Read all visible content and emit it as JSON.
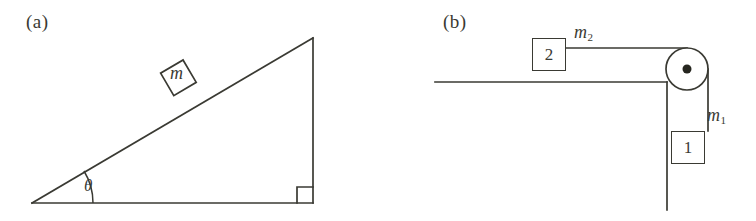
{
  "figure": {
    "width": 756,
    "height": 221,
    "background_color": "#ffffff",
    "line_color": "#3a3a33",
    "type": "physics-mechanics-diagram",
    "panel_count": 2
  },
  "panel_a": {
    "label": "(a)",
    "description": "Inclined plane with a block resting on the incline surface",
    "mass_label": "m",
    "angle_label": "θ",
    "right_angle_marker": true,
    "geometry": {
      "apex_left": [
        32,
        203
      ],
      "corner_bottom_right": [
        313,
        203
      ],
      "corner_top_right": [
        313,
        38
      ],
      "incline_angle_degrees": 30
    },
    "block": {
      "shape": "square",
      "size": 26,
      "rotation_degrees": 30,
      "position_along_incline": 0.47
    }
  },
  "panel_b": {
    "label": "(b)",
    "description": "Two blocks connected by a string over a pulley at the table edge",
    "table_block": {
      "number": "2",
      "mass_label": "m",
      "mass_subscript": "2"
    },
    "hanging_block": {
      "number": "1",
      "mass_label": "m",
      "mass_subscript": "1"
    },
    "pulley": {
      "center": [
        687,
        69
      ],
      "radius": 21,
      "axle_dot_radius": 4.5
    },
    "ground_line": {
      "from": [
        435,
        82
      ],
      "to": [
        667,
        82
      ]
    },
    "wall_line": {
      "from": [
        667,
        82
      ],
      "to": [
        667,
        210
      ]
    },
    "string_horizontal": {
      "from": [
        566,
        48
      ],
      "to": [
        687,
        48
      ]
    },
    "string_vertical": {
      "from": [
        708,
        69
      ],
      "to": [
        708,
        131
      ]
    }
  },
  "labels": {
    "panel_a_tag": "(a)",
    "panel_b_tag": "(b)",
    "mass_m": "m",
    "theta": "θ",
    "mass_m2_base": "m",
    "mass_m2_sub": "2",
    "mass_m1_base": "m",
    "mass_m1_sub": "1",
    "block_two_number": "2",
    "block_one_number": "1"
  }
}
